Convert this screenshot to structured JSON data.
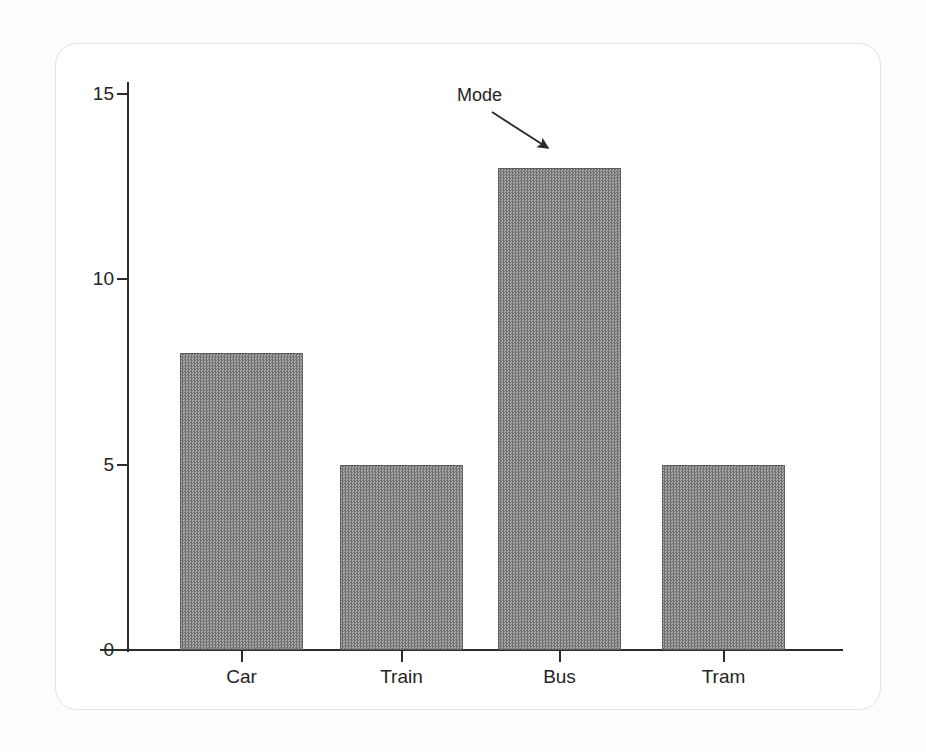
{
  "figure": {
    "background_color": "#ffffff",
    "card_border_color": "#e2e2e2",
    "axis_color": "#2b2b2b",
    "bar_fill_color": "#8e8e8e",
    "bar_edge_color": "#5d5d5d"
  },
  "chart_data": {
    "type": "bar",
    "title": "",
    "xlabel": "",
    "ylabel": "",
    "categories": [
      "Car",
      "Train",
      "Bus",
      "Tram"
    ],
    "values": [
      8,
      5,
      13,
      5
    ],
    "ylim": [
      0,
      15.3
    ],
    "yticks": [
      0,
      5,
      10,
      15
    ],
    "ytick_labels": [
      "0",
      "5",
      "10",
      "15"
    ],
    "grid": false,
    "legend": null,
    "annotations": [
      {
        "text": "Mode",
        "points_to_category": "Bus",
        "points_to_value": 13,
        "arrow_direction": "down-right"
      }
    ]
  }
}
